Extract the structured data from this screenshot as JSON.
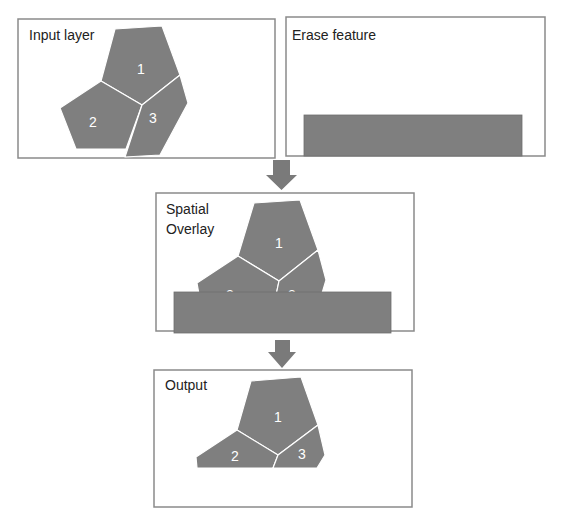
{
  "panels": {
    "input": {
      "title": "Input layer",
      "labels": [
        "1",
        "2",
        "3"
      ]
    },
    "erase": {
      "title": "Erase feature"
    },
    "overlay": {
      "title_line1": "Spatial",
      "title_line2": "Overlay",
      "labels": [
        "1",
        "2",
        "3"
      ]
    },
    "output": {
      "title": "Output",
      "labels": [
        "1",
        "2",
        "3"
      ]
    }
  },
  "colors": {
    "feature_fill": "#7f7f7f",
    "border": "#8a8a8a",
    "arrow": "#7a7a7a"
  }
}
